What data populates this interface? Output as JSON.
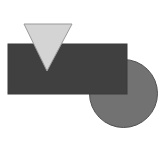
{
  "canvas": {
    "width": 168,
    "height": 145,
    "background": "#ffffff"
  },
  "shapes": {
    "rectangle": {
      "x": 8,
      "y": 44,
      "width": 119,
      "height": 50,
      "fill": "#404040",
      "stroke": "#3a3a3a"
    },
    "circle": {
      "cx": 123.5,
      "cy": 93.5,
      "r": 34,
      "fill": "#727272",
      "stroke": "#505050"
    },
    "triangle": {
      "points": "24,24 72,24 47,71",
      "fill": "#d4d4d4",
      "stroke": "#9a9a9a"
    }
  },
  "layering": [
    "circle",
    "rectangle",
    "triangle"
  ]
}
